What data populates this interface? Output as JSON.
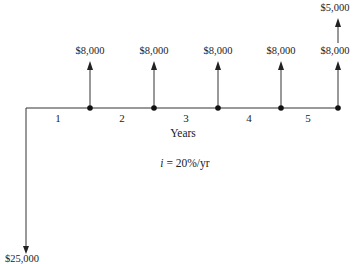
{
  "diagram": {
    "type": "cash-flow-diagram",
    "axis_label": "Years",
    "interest": {
      "symbol": "i",
      "text": " = 20%/yr"
    },
    "periods": [
      "1",
      "2",
      "3",
      "4",
      "5"
    ],
    "initial_outflow": {
      "label": "$25,000",
      "year": 0,
      "direction": "down"
    },
    "inflows": [
      {
        "year": 1,
        "label": "$8,000"
      },
      {
        "year": 2,
        "label": "$8,000"
      },
      {
        "year": 3,
        "label": "$8,000"
      },
      {
        "year": 4,
        "label": "$8,000"
      },
      {
        "year": 5,
        "label": "$8,000"
      }
    ],
    "extra_inflow": {
      "year": 5,
      "label": "$5,000"
    },
    "colors": {
      "line": "#222222",
      "text": "#222222"
    }
  }
}
